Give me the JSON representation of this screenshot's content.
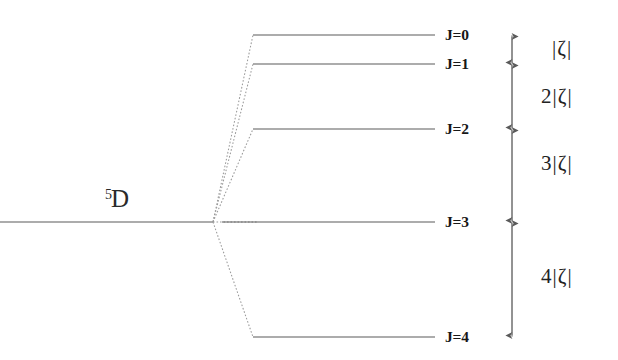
{
  "figure": {
    "kind": "energy-level-splitting-diagram",
    "line_color": "#5a5a5a",
    "dotted_color": "#8e8e8e",
    "arrow_color": "#5a5a5a",
    "text_color": "#1a1a1a",
    "background": "#ffffff"
  },
  "term": {
    "multiplicity": "5",
    "letter": "D",
    "full": "5D",
    "x": 104,
    "y": 186
  },
  "unsplit_level": {
    "label": "unsplit-5D-level",
    "x1": 0,
    "x2": 213,
    "y": 222
  },
  "convergence_point": {
    "x": 213,
    "y": 222
  },
  "levels": [
    {
      "label": "J=0",
      "j": 0,
      "y": 35,
      "x1": 253,
      "x2": 435,
      "label_x": 445,
      "label_y": 27
    },
    {
      "label": "J=1",
      "j": 1,
      "y": 64,
      "x1": 253,
      "x2": 435,
      "label_x": 445,
      "label_y": 56
    },
    {
      "label": "J=2",
      "j": 2,
      "y": 129,
      "x1": 253,
      "x2": 435,
      "label_x": 445,
      "label_y": 121
    },
    {
      "label": "J=3",
      "j": 3,
      "y": 222,
      "x1": 222,
      "x2": 435,
      "label_x": 445,
      "label_y": 214
    },
    {
      "label": "J=4",
      "j": 4,
      "y": 337,
      "x1": 253,
      "x2": 435,
      "label_x": 445,
      "label_y": 329
    }
  ],
  "interval_axis": {
    "x": 512,
    "top": 32,
    "bottom": 340,
    "ticks": [
      35,
      64,
      129,
      222,
      337
    ]
  },
  "intervals": [
    {
      "label": "|ζ|",
      "coefficient": "",
      "symbol": "|ζ|",
      "from_j": 0,
      "to_j": 1,
      "x": 554,
      "y": 38
    },
    {
      "label": "2|ζ|",
      "coefficient": "2",
      "symbol": "|ζ|",
      "from_j": 1,
      "to_j": 2,
      "x": 546,
      "y": 85
    },
    {
      "label": "3|ζ|",
      "coefficient": "3",
      "symbol": "|ζ|",
      "from_j": 2,
      "to_j": 3,
      "x": 546,
      "y": 152
    },
    {
      "label": "4|ζ|",
      "coefficient": "4",
      "symbol": "|ζ|",
      "from_j": 3,
      "to_j": 4,
      "x": 546,
      "y": 265
    }
  ]
}
